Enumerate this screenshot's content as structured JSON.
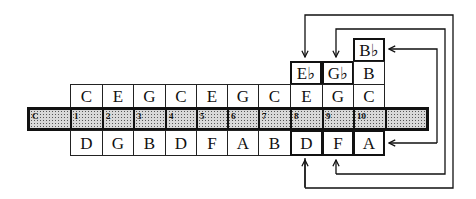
{
  "diagram": {
    "top_row": [
      "C",
      "E",
      "G",
      "C",
      "E",
      "G",
      "C",
      "E",
      "G",
      "C"
    ],
    "bottom_row": [
      "D",
      "G",
      "B",
      "D",
      "F",
      "A",
      "B",
      "D",
      "F",
      "A"
    ],
    "bar_labels": [
      "C",
      "1",
      "2",
      "3",
      "4",
      "5",
      "6",
      "7",
      "8",
      "9",
      "10",
      ""
    ],
    "upper_row": {
      "col8": "E♭",
      "col9": "G♭",
      "col10": "B"
    },
    "top_stack": {
      "col10": "B♭"
    },
    "highlighted_cells": [
      "E♭ (hole 8 top)",
      "G♭ (hole 9 top)",
      "B♭ (hole 10 top)",
      "D (hole 8 bottom)",
      "F (hole 9 bottom)",
      "A (hole 10 bottom)"
    ],
    "arrows": [
      {
        "from": "D (hole 8 blow/draw)",
        "to": "E♭"
      },
      {
        "from": "F (hole 9)",
        "to": "G♭"
      },
      {
        "from": "A (hole 10)",
        "to": "B♭"
      }
    ]
  }
}
